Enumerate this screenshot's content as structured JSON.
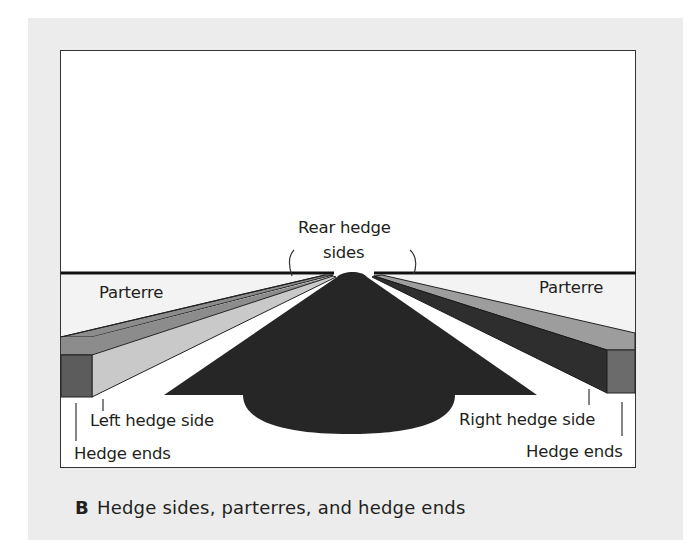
{
  "figure": {
    "caption_letter": "B",
    "caption_text": "Hedge sides, parterres, and hedge ends"
  },
  "labels": {
    "rear_hedge_line1": "Rear hedge",
    "rear_hedge_line2": "sides",
    "parterre_left": "Parterre",
    "parterre_right": "Parterre",
    "left_hedge_side": "Left hedge side",
    "right_hedge_side": "Right hedge side",
    "hedge_ends_left": "Hedge ends",
    "hedge_ends_right": "Hedge ends"
  },
  "colors": {
    "panel_bg": "#ececec",
    "frame_bg": "#ffffff",
    "parterre": "#f2f2f2",
    "path": "#262626",
    "left_top_face": "#8c8c8c",
    "left_side_face": "#c9c9c9",
    "left_end_face": "#5c5c5c",
    "right_top_face": "#9d9d9d",
    "right_side_face": "#2e2e2e",
    "right_end_face": "#6b6b6b",
    "horizon": "#111111"
  }
}
